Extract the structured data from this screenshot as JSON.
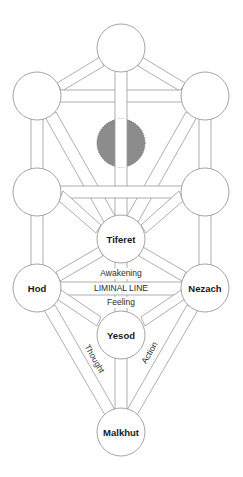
{
  "diagram": {
    "type": "tree-of-life",
    "nodes": [
      {
        "id": "keter",
        "label": "",
        "cx": 121,
        "cy": 48,
        "r": 24,
        "style": "plain"
      },
      {
        "id": "upper-left",
        "label": "",
        "cx": 37,
        "cy": 96,
        "r": 24,
        "style": "plain"
      },
      {
        "id": "upper-right",
        "label": "",
        "cx": 205,
        "cy": 96,
        "r": 24,
        "style": "plain"
      },
      {
        "id": "hidden",
        "label": "",
        "cx": 121,
        "cy": 143,
        "r": 24,
        "style": "hidden",
        "fill": "#8c8c8c"
      },
      {
        "id": "middle-left",
        "label": "",
        "cx": 37,
        "cy": 192,
        "r": 24,
        "style": "plain"
      },
      {
        "id": "middle-right",
        "label": "",
        "cx": 205,
        "cy": 192,
        "r": 24,
        "style": "plain"
      },
      {
        "id": "tiferet",
        "label": "Tiferet",
        "cx": 121,
        "cy": 239,
        "r": 24,
        "style": "plain"
      },
      {
        "id": "hod",
        "label": "Hod",
        "cx": 37,
        "cy": 288,
        "r": 24,
        "style": "plain"
      },
      {
        "id": "nezach",
        "label": "Nezach",
        "cx": 205,
        "cy": 288,
        "r": 24,
        "style": "plain"
      },
      {
        "id": "yesod",
        "label": "Yesod",
        "cx": 121,
        "cy": 335,
        "r": 24,
        "style": "plain"
      },
      {
        "id": "malkhut",
        "label": "Malkhut",
        "cx": 121,
        "cy": 432,
        "r": 24,
        "style": "plain"
      }
    ],
    "liminal": {
      "above": "Awakening",
      "line": "LIMINAL LINE",
      "below": "Feeling"
    },
    "path_labels": {
      "left": "Thought",
      "right": "Action"
    },
    "colors": {
      "stroke": "#9a9a9a",
      "hidden_fill": "#8c8c8c",
      "text": "#1a1a1a",
      "background": "#ffffff"
    }
  }
}
